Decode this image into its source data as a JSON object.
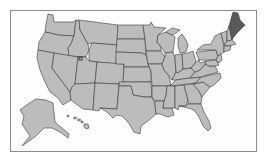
{
  "map": {
    "type": "us-states-choropleth",
    "highlighted_states": [
      "Maine"
    ],
    "colors": {
      "state_fill": "#bcbcbc",
      "state_border": "#3a3a3a",
      "highlight_fill": "#5a5a5a",
      "background": "#fdfdfd",
      "frame_border": "#8a8a8a"
    },
    "marker": {
      "name": "location-marker",
      "approx_location": "Salt Lake City area, Utah"
    },
    "insets": [
      "Alaska",
      "Hawaii"
    ]
  }
}
